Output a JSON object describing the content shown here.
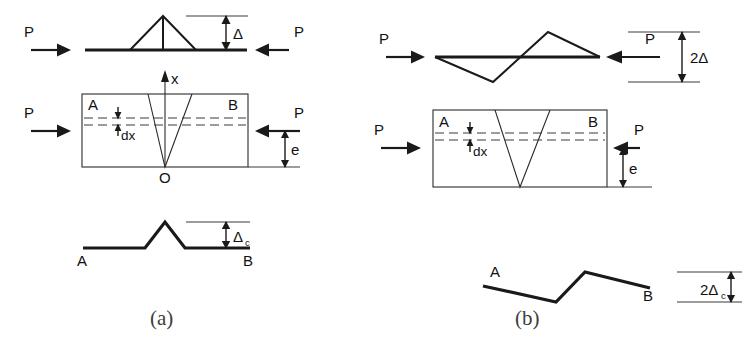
{
  "figure": {
    "width": 742,
    "height": 360,
    "background": "#ffffff",
    "ink_color": "#1a1a1a",
    "dash_color": "#3a3a3a",
    "caption_color": "#3c3c3c"
  },
  "panels": [
    {
      "id": "panel-a",
      "caption": "(a)",
      "description": "Symmetric single-hump buckling mode",
      "load_label_left": "P",
      "load_label_right": "P",
      "deflection_label": "Δ",
      "element_thickness_label": "dx",
      "axis_label": "x",
      "origin_label": "O",
      "eccentricity_label": "e",
      "end_label_left": "A",
      "end_label_right": "B",
      "core_deflection_label": "Δ",
      "core_deflection_sub": "c"
    },
    {
      "id": "panel-b",
      "caption": "(b)",
      "description": "Antisymmetric double-hump buckling mode",
      "load_label_left": "P",
      "load_label_right": "P",
      "deflection_label": "2Δ",
      "element_thickness_label": "dx",
      "eccentricity_label": "e",
      "end_label_left": "A",
      "end_label_right": "B",
      "core_deflection_label": "2Δ",
      "core_deflection_sub": "c"
    }
  ],
  "labels": {
    "P": "P",
    "A": "A",
    "B": "B",
    "O": "O",
    "x": "x",
    "e": "e",
    "dx": "dx",
    "delta": "Δ",
    "two_delta": "2Δ",
    "delta_c_main": "Δ",
    "delta_c_sub": "c",
    "two_delta_c_main": "2Δ",
    "two_delta_c_sub": "c",
    "caption_a": "(a)",
    "caption_b": "(b)"
  }
}
